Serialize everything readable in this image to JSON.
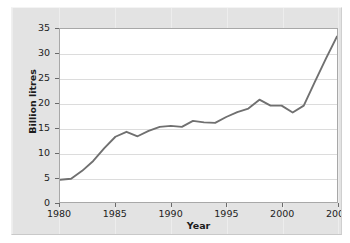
{
  "chart_data": {
    "type": "line",
    "title": "",
    "xlabel": "Year",
    "ylabel": "Billion litres",
    "xlim": [
      1980,
      2005
    ],
    "ylim": [
      0,
      35
    ],
    "grid": "horizontal",
    "legend": "none",
    "line_color": "#707070",
    "x_ticks": [
      "1980",
      "1985",
      "1990",
      "1995",
      "2000",
      "2005"
    ],
    "x_tick_values": [
      1980,
      1985,
      1990,
      1995,
      2000,
      2005
    ],
    "y_ticks": [
      "0",
      "5",
      "10",
      "15",
      "20",
      "25",
      "30",
      "35"
    ],
    "y_tick_values": [
      0,
      5,
      10,
      15,
      20,
      25,
      30,
      35
    ],
    "series": [
      {
        "name": "Billion litres",
        "x": [
          1980,
          1981,
          1982,
          1983,
          1984,
          1985,
          1986,
          1987,
          1988,
          1989,
          1990,
          1991,
          1992,
          1993,
          1994,
          1995,
          1996,
          1997,
          1998,
          1999,
          2000,
          2001,
          2002,
          2003,
          2004,
          2005
        ],
        "values": [
          4.5,
          4.7,
          6.3,
          8.3,
          10.9,
          13.2,
          14.2,
          13.3,
          14.4,
          15.2,
          15.4,
          15.2,
          16.4,
          16.1,
          16.0,
          17.2,
          18.2,
          18.9,
          20.7,
          19.5,
          19.5,
          18.1,
          19.5,
          24.3,
          29.0,
          33.5
        ]
      }
    ]
  },
  "axes": {
    "y_title": "Billion litres",
    "x_title": "Year"
  }
}
